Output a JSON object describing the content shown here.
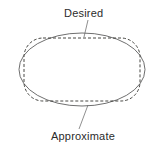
{
  "figure": {
    "background_color": "#ffffff",
    "width": 163,
    "height": 151,
    "labels": {
      "desired": "Desired",
      "approximate": "Approximate"
    },
    "shapes": {
      "desired": {
        "icon_name": "solid-ellipse-outline",
        "style": "solid",
        "stroke_color": "#4a4a4a",
        "center_x": 82,
        "center_y": 69.5,
        "radius_x": 63,
        "radius_y": 36.5
      },
      "approximate": {
        "icon_name": "dashed-rounded-rectangle-outline",
        "style": "dashed",
        "stroke_color": "#33332f",
        "left": 24,
        "top": 38,
        "width": 116,
        "height": 63,
        "corner_radius": 19,
        "dash_pattern": "3 2"
      }
    },
    "leaders": {
      "desired": {
        "icon_name": "leader-line",
        "from_x": 88,
        "from_y": 20,
        "to_x": 84,
        "to_y": 37
      },
      "approximate": {
        "icon_name": "leader-line",
        "from_x": 79,
        "from_y": 129,
        "to_x": 88,
        "to_y": 105
      }
    }
  }
}
